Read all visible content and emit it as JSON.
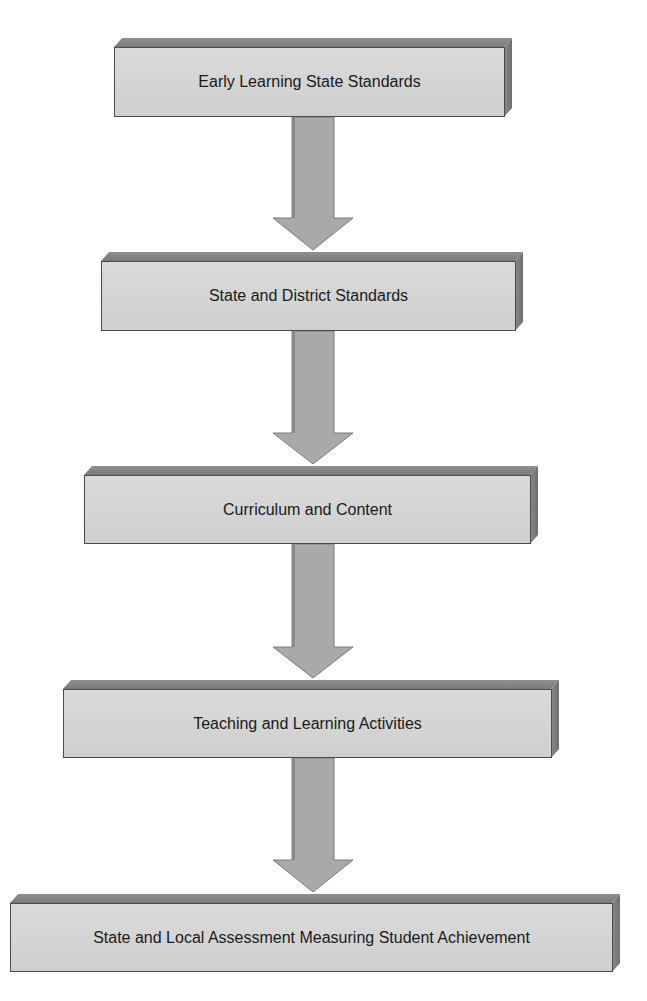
{
  "diagram": {
    "type": "vertical-flowchart",
    "boxes": [
      {
        "label": "Early Learning State Standards",
        "x": 114,
        "y": 38,
        "w": 398,
        "h": 79
      },
      {
        "label": "State and District Standards",
        "x": 101,
        "y": 252,
        "w": 422,
        "h": 79
      },
      {
        "label": "Curriculum and Content",
        "x": 84,
        "y": 466,
        "w": 454,
        "h": 78
      },
      {
        "label": "Teaching and Learning Activities",
        "x": 63,
        "y": 680,
        "w": 496,
        "h": 78
      },
      {
        "label": "State and Local Assessment Measuring Student Achievement",
        "x": 10,
        "y": 894,
        "w": 610,
        "h": 78
      }
    ],
    "arrows": [
      {
        "from": 0,
        "to": 1,
        "y1": 117,
        "y2": 251
      },
      {
        "from": 1,
        "to": 2,
        "y1": 331,
        "y2": 465
      },
      {
        "from": 2,
        "to": 3,
        "y1": 544,
        "y2": 679
      },
      {
        "from": 3,
        "to": 4,
        "y1": 758,
        "y2": 893
      }
    ],
    "colors": {
      "face": "#d4d4d4",
      "bevel_top": "#858585",
      "bevel_side": "#7a7a7a",
      "arrow": "#a8a8a8",
      "text": "#1a1a1a"
    }
  }
}
